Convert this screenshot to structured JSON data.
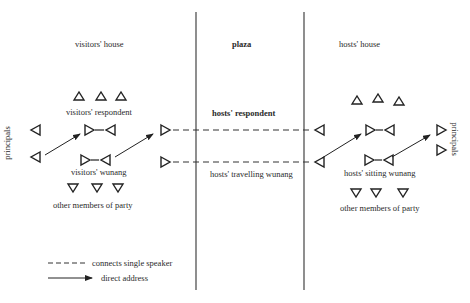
{
  "regions": {
    "visitors_house": "visitors' house",
    "plaza": "plaza",
    "hosts_house": "hosts' house"
  },
  "labels": {
    "visitors_respondent": "visitors' respondent",
    "visitors_wunang": "visitors' wunang",
    "visitors_other": "other members of party",
    "principals_left": "principals",
    "principals_right": "principals",
    "hosts_respondent": "hosts' respondent",
    "hosts_travelling_wunang": "hosts' travelling wunang",
    "hosts_sitting_wunang": "hosts' sitting wunang",
    "hosts_other": "other members of party"
  },
  "legend": {
    "dashed": "connects single speaker",
    "arrow": "direct address"
  },
  "colors": {
    "ink": "#2a2a2a",
    "background": "#ffffff"
  }
}
